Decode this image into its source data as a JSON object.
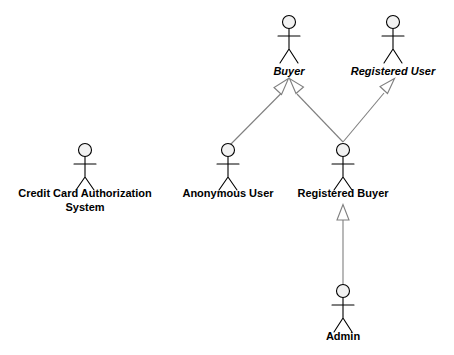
{
  "diagram": {
    "type": "uml-actor-generalization-diagram",
    "width": 454,
    "height": 355,
    "background_color": "#ffffff",
    "line_color": "#7f7f7f",
    "stroke_color": "#000000",
    "head_fill_color": "#f2f2f2",
    "actors": [
      {
        "id": "buyer",
        "label": "Buyer",
        "abstract": true,
        "x": 289,
        "label_y": 75,
        "head_cy": 22,
        "label_lines": [
          "Buyer"
        ]
      },
      {
        "id": "registered-user",
        "label": "Registered User",
        "abstract": true,
        "x": 393,
        "label_y": 75,
        "head_cy": 22,
        "label_lines": [
          "Registered User"
        ]
      },
      {
        "id": "credit-card-authorization-system",
        "label": "Credit Card Authorization System",
        "abstract": false,
        "x": 85,
        "label_y": 197,
        "head_cy": 150,
        "label_lines": [
          "Credit Card Authorization",
          "System"
        ]
      },
      {
        "id": "anonymous-user",
        "label": "Anonymous User",
        "abstract": false,
        "x": 228,
        "label_y": 197,
        "head_cy": 150,
        "label_lines": [
          "Anonymous User"
        ]
      },
      {
        "id": "registered-buyer",
        "label": "Registered Buyer",
        "abstract": false,
        "x": 343,
        "label_y": 197,
        "head_cy": 150,
        "label_lines": [
          "Registered Buyer"
        ]
      },
      {
        "id": "admin",
        "label": "Admin",
        "abstract": false,
        "x": 343,
        "label_y": 340,
        "head_cy": 291,
        "label_lines": [
          "Admin"
        ]
      }
    ],
    "generalizations": [
      {
        "id": "anonymous-user-to-buyer",
        "from": "anonymous-user",
        "to": "buyer"
      },
      {
        "id": "registered-buyer-to-buyer",
        "from": "registered-buyer",
        "to": "buyer"
      },
      {
        "id": "registered-buyer-to-registered-user",
        "from": "registered-buyer",
        "to": "registered-user"
      },
      {
        "id": "admin-to-registered-buyer",
        "from": "admin",
        "to": "registered-buyer"
      }
    ]
  }
}
